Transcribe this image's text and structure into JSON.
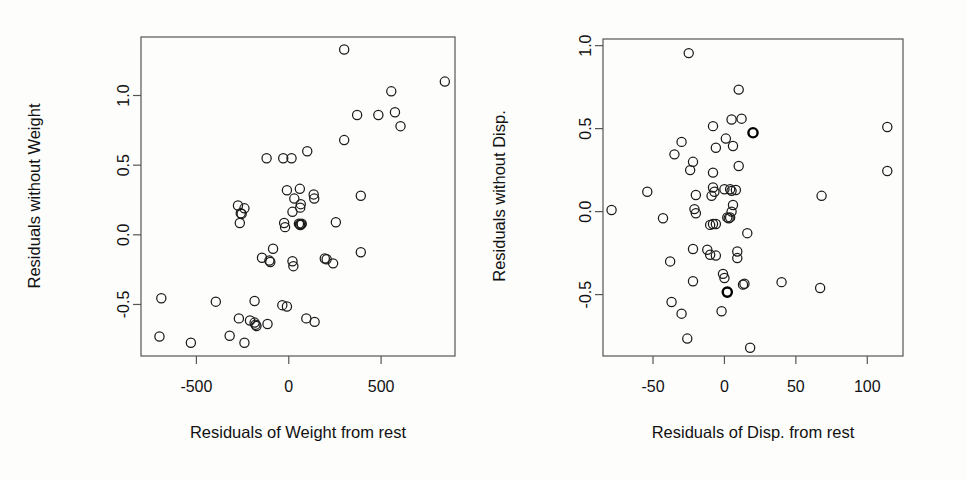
{
  "figure": {
    "type": "added-variable-plots",
    "background_color": "#fdfdfc",
    "point_color": "#1a1a1a",
    "panel_count": 2
  },
  "chart_data": [
    {
      "type": "scatter",
      "title": "",
      "xlabel": "Residuals of Weight from rest",
      "ylabel": "Residuals without Weight",
      "xticks": [
        -500,
        0,
        500
      ],
      "xticklabels": [
        "-500",
        "0",
        "500"
      ],
      "yticks": [
        1.0,
        0.5,
        0.0,
        -0.5
      ],
      "yticklabels": [
        "1.0",
        "0.5",
        "0.0",
        "-0.5"
      ],
      "xlim": [
        -800,
        900
      ],
      "ylim": [
        -0.87,
        1.42
      ],
      "grid": false,
      "legend": "none",
      "marker": "open-circle",
      "points": [
        [
          300,
          1.33
        ],
        [
          845,
          1.1
        ],
        [
          555,
          1.03
        ],
        [
          370,
          0.86
        ],
        [
          485,
          0.86
        ],
        [
          575,
          0.88
        ],
        [
          605,
          0.78
        ],
        [
          300,
          0.68
        ],
        [
          100,
          0.6
        ],
        [
          -120,
          0.55
        ],
        [
          15,
          0.55
        ],
        [
          -30,
          0.55
        ],
        [
          60,
          0.33
        ],
        [
          -10,
          0.32
        ],
        [
          135,
          0.29
        ],
        [
          138,
          0.26
        ],
        [
          30,
          0.26
        ],
        [
          390,
          0.28
        ],
        [
          -275,
          0.21
        ],
        [
          -240,
          0.19
        ],
        [
          -260,
          0.155
        ],
        [
          -255,
          0.15
        ],
        [
          65,
          0.22
        ],
        [
          62,
          0.195
        ],
        [
          20,
          0.165
        ],
        [
          -265,
          0.085
        ],
        [
          -25,
          0.085
        ],
        [
          -20,
          0.055
        ],
        [
          55,
          0.08
        ],
        [
          60,
          0.075
        ],
        [
          62,
          0.07
        ],
        [
          68,
          0.075
        ],
        [
          70,
          0.08
        ],
        [
          255,
          0.09
        ],
        [
          -85,
          -0.1
        ],
        [
          390,
          -0.125
        ],
        [
          -145,
          -0.165
        ],
        [
          -105,
          -0.185
        ],
        [
          -100,
          -0.195
        ],
        [
          195,
          -0.17
        ],
        [
          205,
          -0.175
        ],
        [
          20,
          -0.19
        ],
        [
          25,
          -0.225
        ],
        [
          240,
          -0.205
        ],
        [
          -690,
          -0.455
        ],
        [
          -395,
          -0.48
        ],
        [
          -185,
          -0.475
        ],
        [
          -35,
          -0.505
        ],
        [
          -10,
          -0.515
        ],
        [
          -270,
          -0.6
        ],
        [
          -210,
          -0.615
        ],
        [
          -185,
          -0.63
        ],
        [
          -180,
          -0.645
        ],
        [
          -175,
          -0.655
        ],
        [
          -115,
          -0.64
        ],
        [
          95,
          -0.6
        ],
        [
          140,
          -0.625
        ],
        [
          -700,
          -0.73
        ],
        [
          -320,
          -0.725
        ],
        [
          -530,
          -0.775
        ],
        [
          -240,
          -0.775
        ]
      ]
    },
    {
      "type": "scatter",
      "title": "",
      "xlabel": "Residuals of Disp. from rest",
      "ylabel": "Residuals without Disp.",
      "xticks": [
        -50,
        0,
        50,
        100
      ],
      "xticklabels": [
        "-50",
        "0",
        "50",
        "100"
      ],
      "yticks": [
        1.0,
        0.5,
        0.0,
        -0.5
      ],
      "yticklabels": [
        "1.0",
        "0.5",
        "0.0",
        "-0.5"
      ],
      "xlim": [
        -85,
        125
      ],
      "ylim": [
        -0.87,
        1.04
      ],
      "grid": false,
      "legend": "none",
      "marker": "open-circle",
      "points": [
        [
          -25,
          0.955
        ],
        [
          10,
          0.735
        ],
        [
          5,
          0.555
        ],
        [
          12,
          0.56
        ],
        [
          -8,
          0.515
        ],
        [
          114,
          0.51
        ],
        [
          -30,
          0.42
        ],
        [
          20,
          0.475
        ],
        [
          1,
          0.44
        ],
        [
          -6,
          0.385
        ],
        [
          6,
          0.395
        ],
        [
          -35,
          0.345
        ],
        [
          -22,
          0.3
        ],
        [
          10,
          0.275
        ],
        [
          -24,
          0.25
        ],
        [
          -8,
          0.235
        ],
        [
          114,
          0.245
        ],
        [
          -54,
          0.12
        ],
        [
          -20,
          0.1
        ],
        [
          -8,
          0.145
        ],
        [
          -7,
          0.12
        ],
        [
          0,
          0.135
        ],
        [
          4,
          0.135
        ],
        [
          5,
          0.125
        ],
        [
          8,
          0.13
        ],
        [
          -9,
          0.095
        ],
        [
          68,
          0.095
        ],
        [
          -79,
          0.01
        ],
        [
          -21,
          0.015
        ],
        [
          -20,
          -0.01
        ],
        [
          2,
          -0.035
        ],
        [
          3,
          -0.04
        ],
        [
          4,
          -0.035
        ],
        [
          6,
          0.04
        ],
        [
          5,
          0.0
        ],
        [
          -43,
          -0.04
        ],
        [
          -10,
          -0.08
        ],
        [
          -8,
          -0.075
        ],
        [
          -6,
          -0.075
        ],
        [
          16,
          -0.13
        ],
        [
          -22,
          -0.225
        ],
        [
          -12,
          -0.23
        ],
        [
          -10,
          -0.26
        ],
        [
          -6,
          -0.265
        ],
        [
          9,
          -0.24
        ],
        [
          9,
          -0.28
        ],
        [
          -38,
          -0.3
        ],
        [
          -1,
          -0.375
        ],
        [
          0,
          -0.4
        ],
        [
          -22,
          -0.42
        ],
        [
          40,
          -0.425
        ],
        [
          13,
          -0.44
        ],
        [
          14,
          -0.435
        ],
        [
          2,
          -0.485
        ],
        [
          67,
          -0.46
        ],
        [
          -37,
          -0.545
        ],
        [
          -30,
          -0.615
        ],
        [
          -2,
          -0.6
        ],
        [
          -26,
          -0.765
        ],
        [
          18,
          -0.82
        ]
      ],
      "highlighted_points": [
        [
          20,
          0.475
        ],
        [
          2,
          -0.485
        ]
      ]
    }
  ]
}
